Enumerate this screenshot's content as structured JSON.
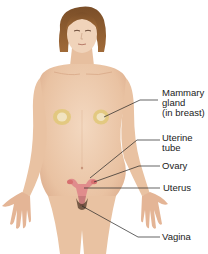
{
  "figure": {
    "colors": {
      "skin": "#ecc9ad",
      "skin_shadow": "#d9a888",
      "hair": "#8a5a2e",
      "mammary_gland": "#d8c070",
      "organs": "#d98b8b",
      "leader_line": "#222222",
      "label_text": "#222222"
    }
  },
  "labels": {
    "mammary": {
      "line1": "Mammary",
      "line2": "gland",
      "line3": "(in breast)"
    },
    "uterine_tube": {
      "line1": "Uterine",
      "line2": "tube"
    },
    "ovary": {
      "line1": "Ovary"
    },
    "uterus": {
      "line1": "Uterus"
    },
    "vagina": {
      "line1": "Vagina"
    }
  }
}
